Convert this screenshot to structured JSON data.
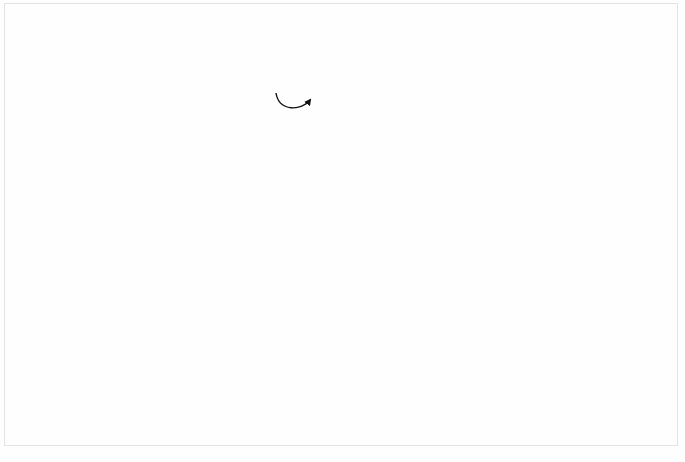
{
  "figure": {
    "caption": "FIGURE 5-1",
    "type": "structure-chart",
    "notation": "Yourdon/Constantine structure chart",
    "background_color": "#fefefe",
    "module_fill_color": "#808080",
    "module_text_color": "#ffffff",
    "callout_fill_color": "#b6b6b6",
    "line_color": "#3a3a3a"
  },
  "modules": [
    {
      "id": "system",
      "name": "SYSTEM MODULE",
      "lines": [
        "SYSTEM",
        "MODULE"
      ],
      "x": 265,
      "y": 26,
      "w": 113,
      "h": 62,
      "library": false
    },
    {
      "id": "a",
      "name": "MODULE A",
      "lines": [
        "MODULE",
        "A"
      ],
      "x": 88,
      "y": 143,
      "w": 108,
      "h": 59,
      "library": false
    },
    {
      "id": "b",
      "name": "MODULE B",
      "lines": [
        "MODULE",
        "B"
      ],
      "x": 435,
      "y": 143,
      "w": 110,
      "h": 59,
      "library": false
    },
    {
      "id": "c",
      "name": "MODULE C",
      "lines": [
        "MODULE",
        "C"
      ],
      "x": 14,
      "y": 268,
      "w": 97,
      "h": 57,
      "library": false
    },
    {
      "id": "d",
      "name": "MODULE D",
      "lines": [
        "MODULE",
        "D"
      ],
      "x": 155,
      "y": 268,
      "w": 97,
      "h": 57,
      "library": false
    },
    {
      "id": "e",
      "name": "MODULE E",
      "lines": [
        "MODULE",
        "E"
      ],
      "x": 292,
      "y": 268,
      "w": 97,
      "h": 57,
      "library": false
    },
    {
      "id": "f",
      "name": "MODULE F",
      "lines": [
        "MODULE",
        "F"
      ],
      "x": 428,
      "y": 268,
      "w": 97,
      "h": 57,
      "library": false
    },
    {
      "id": "g",
      "name": "MODULE G",
      "lines": [
        "MODULE",
        "G"
      ],
      "x": 573,
      "y": 268,
      "w": 97,
      "h": 57,
      "library": false
    },
    {
      "id": "libA",
      "name": "LIBRARY MODULE A",
      "lines": [
        "LIBRARY",
        "MODULE",
        "A"
      ],
      "x": 150,
      "y": 379,
      "w": 100,
      "h": 57,
      "library": true
    }
  ],
  "couples": [
    {
      "id": "cp1",
      "label": "DATA A",
      "lines": [
        "DATA A"
      ],
      "kind": "data",
      "direction": "up",
      "label_x": 124,
      "label_y": 106,
      "sym_x": 176,
      "sym_y": 101
    },
    {
      "id": "cp2",
      "label": "DATA B",
      "lines": [
        "DATA B"
      ],
      "kind": "data",
      "direction": "down",
      "label_x": 336,
      "label_y": 115,
      "sym_x": 386,
      "sym_y": 110
    },
    {
      "id": "cp3",
      "label": "FLAG A",
      "lines": [
        "FLAG A"
      ],
      "kind": "flag",
      "direction": "up",
      "label_x": 53,
      "label_y": 211,
      "sym_x": 92,
      "sym_y": 206
    },
    {
      "id": "cp4",
      "label": "DATA A",
      "lines": [
        "DATA A"
      ],
      "kind": "data",
      "direction": "up",
      "label_x": 22,
      "label_y": 241,
      "sym_x": 65,
      "sym_y": 236
    },
    {
      "id": "cp5",
      "label": "DATA B",
      "lines": [
        "DATA B"
      ],
      "kind": "data",
      "direction": "up",
      "label_x": 131,
      "label_y": 251,
      "sym_x": 175,
      "sym_y": 246
    },
    {
      "id": "cp6",
      "label": "FLAG B",
      "lines": [
        "FLAG B"
      ],
      "kind": "flag",
      "direction": "up",
      "label_x": 366,
      "label_y": 215,
      "sym_x": 409,
      "sym_y": 210
    },
    {
      "id": "cp7",
      "label": "DATA C",
      "lines": [
        "DATA C"
      ],
      "kind": "data",
      "direction": "up",
      "label_x": 310,
      "label_y": 249,
      "sym_x": 353,
      "sym_y": 244
    },
    {
      "id": "cp8",
      "label": "DATA D",
      "lines": [
        "DATA D"
      ],
      "kind": "data",
      "direction": "up",
      "label_x": 437,
      "label_y": 249,
      "sym_x": 479,
      "sym_y": 244
    },
    {
      "id": "cp9",
      "label": "FLAG B",
      "lines": [
        "FLAG B"
      ],
      "kind": "flag",
      "direction": "down",
      "label_x": 510,
      "label_y": 217,
      "sym_x": 551,
      "sym_y": 213
    },
    {
      "id": "cp10",
      "label": "DATA B AND C/D",
      "lines": [
        "DATA B",
        "AND C/D"
      ],
      "kind": "data",
      "direction": "down",
      "label_x": 546,
      "label_y": 247,
      "sym_x": 596,
      "sym_y": 244
    },
    {
      "id": "cp11",
      "label": "DATA B",
      "lines": [
        "DATA B"
      ],
      "kind": "data",
      "direction": "up",
      "label_x": 148,
      "label_y": 352,
      "sym_x": 192,
      "sym_y": 347
    }
  ],
  "callouts": [
    {
      "id": "n1",
      "number": "1",
      "x": 307,
      "y": 8,
      "refers_to": "system module box"
    },
    {
      "id": "n2",
      "number": "2",
      "x": 432,
      "y": 109,
      "refers_to": "connection line"
    },
    {
      "id": "n3",
      "number": "3",
      "x": 277,
      "y": 113,
      "refers_to": "iteration arc"
    },
    {
      "id": "n4",
      "number": "4",
      "x": 130,
      "y": 216,
      "refers_to": "selection diamond module A"
    },
    {
      "id": "n5",
      "number": "5",
      "x": 11,
      "y": 247,
      "refers_to": "data couple"
    },
    {
      "id": "n6",
      "number": "6",
      "x": 38,
      "y": 207,
      "refers_to": "flag couple"
    },
    {
      "id": "n4b",
      "number": "4",
      "x": 486,
      "y": 216,
      "refers_to": "selection diamond module B"
    },
    {
      "id": "n5b",
      "number": "5",
      "x": 349,
      "y": 118,
      "refers_to": "data couple"
    },
    {
      "id": "n6b",
      "number": "6",
      "x": 519,
      "y": 230,
      "refers_to": "flag couple"
    },
    {
      "id": "n7",
      "number": "7",
      "x": 233,
      "y": 366,
      "refers_to": "library module"
    }
  ]
}
